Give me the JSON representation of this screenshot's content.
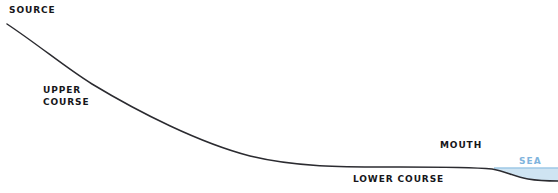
{
  "diagram": {
    "background_color": "#ffffff",
    "labels": {
      "source": "SOURCE",
      "upper_course_line1": "UPPER",
      "upper_course_line2": "COURSE",
      "lower_course": "LOWER COURSE",
      "mouth": "MOUTH",
      "sea": "SEA"
    },
    "colors": {
      "profile_line": "#2b2b30",
      "sea_fill": "#cfe4f2",
      "sea_level_line": "#9ec9e6",
      "sea_text": "#7fb4dd",
      "label_text": "#16161a"
    },
    "geometry": {
      "profile_path": "M 7 24 C 40 46 66 68 92 84 C 140 113 200 143 250 156 C 300 168 350 167 400 167 C 440 167 470 167 492 169 C 505 171 515 177 528 179 C 540 181 549 181 558 181",
      "sea_level_y": 168,
      "sea_start_x": 494,
      "sea_end_x": 558,
      "source_point": [
        7,
        24
      ],
      "mouth_point": [
        494,
        169
      ]
    }
  },
  "chart_data": {
    "type": "line",
    "xlabel": "",
    "ylabel": "",
    "annotations": [
      "SOURCE",
      "UPPER COURSE",
      "LOWER COURSE",
      "MOUTH",
      "SEA"
    ],
    "series": [
      {
        "name": "River bed profile",
        "x": [
          7,
          40,
          92,
          150,
          200,
          250,
          300,
          350,
          400,
          450,
          494,
          520,
          558
        ],
        "y": [
          24,
          46,
          84,
          118,
          139,
          156,
          163,
          166,
          167,
          167,
          169,
          177,
          181
        ]
      },
      {
        "name": "Sea level",
        "x": [
          494,
          558
        ],
        "y": [
          168,
          168
        ]
      }
    ]
  }
}
